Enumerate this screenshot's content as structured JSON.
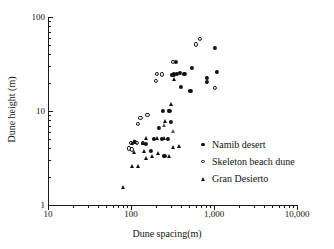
{
  "chart_data": {
    "type": "scatter",
    "title": "",
    "xlabel": "Dune spacing(m)",
    "ylabel": "Dune height (m)",
    "xscale": "log",
    "yscale": "log",
    "xlim": [
      10,
      10000
    ],
    "ylim": [
      1,
      100
    ],
    "xticks": [
      "10",
      "100",
      "1,000",
      "10,000"
    ],
    "xtick_values": [
      10,
      100,
      1000,
      10000
    ],
    "yticks": [
      "1",
      "10",
      "100"
    ],
    "ytick_values": [
      1,
      10,
      100
    ],
    "grid": false,
    "legend_position": "center-right",
    "series": [
      {
        "name": "Namib desert",
        "marker": "filled-circle",
        "color": "#101010",
        "points": [
          [
            150,
            4.5
          ],
          [
            175,
            3.8
          ],
          [
            190,
            5.0
          ],
          [
            215,
            6.6
          ],
          [
            235,
            5.0
          ],
          [
            245,
            10.0
          ],
          [
            252,
            3.3
          ],
          [
            280,
            5.0
          ],
          [
            290,
            10.0
          ],
          [
            300,
            7.6
          ],
          [
            310,
            24.0
          ],
          [
            330,
            24.5
          ],
          [
            345,
            33.0
          ],
          [
            355,
            25.0
          ],
          [
            390,
            25.5
          ],
          [
            395,
            18.0
          ],
          [
            440,
            25.0
          ],
          [
            520,
            16.5
          ],
          [
            545,
            29.0
          ],
          [
            820,
            20.5
          ],
          [
            825,
            22.5
          ],
          [
            1020,
            47.0
          ],
          [
            1080,
            26.0
          ]
        ]
      },
      {
        "name": "Skeleton beach dune",
        "marker": "open-circle",
        "color": "#101010",
        "points": [
          [
            95,
            4.0
          ],
          [
            100,
            4.6
          ],
          [
            102,
            3.9
          ],
          [
            112,
            4.7
          ],
          [
            118,
            4.6
          ],
          [
            120,
            7.3
          ],
          [
            130,
            8.4
          ],
          [
            140,
            4.6
          ],
          [
            158,
            9.1
          ],
          [
            200,
            21.0
          ],
          [
            205,
            25.0
          ],
          [
            237,
            24.5
          ],
          [
            322,
            33.0
          ],
          [
            600,
            51.0
          ],
          [
            680,
            58.0
          ],
          [
            1030,
            17.5
          ]
        ]
      },
      {
        "name": "Gran Desierto",
        "marker": "filled-triangle",
        "color": "#101010",
        "points": [
          [
            80,
            1.55
          ],
          [
            103,
            2.6
          ],
          [
            104,
            4.6
          ],
          [
            108,
            3.7
          ],
          [
            110,
            4.8
          ],
          [
            112,
            4.7
          ],
          [
            122,
            2.6
          ],
          [
            140,
            4.6
          ],
          [
            145,
            3.8
          ],
          [
            150,
            3.2
          ],
          [
            152,
            5.1
          ],
          [
            178,
            3.3
          ],
          [
            205,
            5.1
          ],
          [
            210,
            3.6
          ],
          [
            250,
            5.1
          ],
          [
            258,
            7.8
          ],
          [
            285,
            3.3
          ],
          [
            300,
            12.0
          ],
          [
            320,
            4.1
          ],
          [
            330,
            22.0
          ],
          [
            380,
            4.2
          ]
        ]
      },
      {
        "name": "Gran Desierto (open)",
        "marker": "open-triangle",
        "color": "#555555",
        "hidden_from_legend": true,
        "points": [
          [
            247,
            7.1
          ],
          [
            322,
            6.1
          ]
        ]
      }
    ]
  },
  "legend": {
    "entries": [
      {
        "label": "Namib desert",
        "marker": "filled-circle"
      },
      {
        "label": "Skeleton beach dune",
        "marker": "open-circle"
      },
      {
        "label": "Gran Desierto",
        "marker": "filled-triangle"
      }
    ]
  }
}
